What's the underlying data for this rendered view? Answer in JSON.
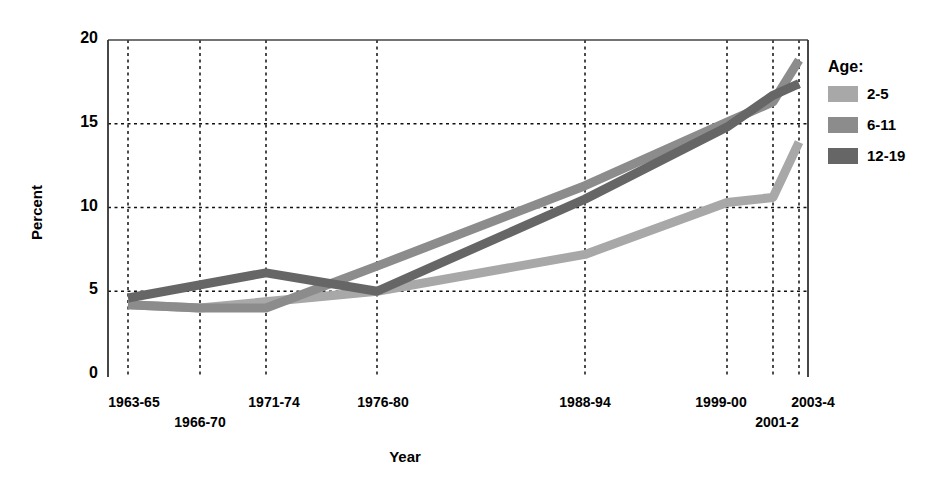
{
  "chart_data": {
    "type": "line",
    "title": "",
    "xlabel": "Year",
    "ylabel": "Percent",
    "categories": [
      "1963-65",
      "1966-70",
      "1971-74",
      "1976-80",
      "1988-94",
      "1999-00",
      "2001-2",
      "2003-4"
    ],
    "x_positions": [
      128,
      200,
      266,
      377,
      585,
      727,
      773,
      799
    ],
    "ylim": [
      0,
      20
    ],
    "yticks": [
      0,
      5,
      10,
      15,
      20
    ],
    "grid": true,
    "legend_position": "right",
    "legend_title": "Age:",
    "series": [
      {
        "name": "2-5",
        "color": "#a8a8a8",
        "values": [
          4.2,
          4.0,
          null,
          5.0,
          7.2,
          10.3,
          10.6,
          13.9
        ]
      },
      {
        "name": "6-11",
        "color": "#8c8c8c",
        "values": [
          4.2,
          4.0,
          4.0,
          6.5,
          11.3,
          15.1,
          16.3,
          18.8
        ]
      },
      {
        "name": "12-19",
        "color": "#666666",
        "values": [
          4.6,
          null,
          6.1,
          5.0,
          10.5,
          14.8,
          16.7,
          17.4
        ]
      }
    ]
  },
  "axis": {
    "y_tick_labels": [
      "20",
      "15",
      "10",
      "5",
      "0"
    ],
    "x_tick_labels": [
      "1963-65",
      "1966-70",
      "1971-74",
      "1976-80",
      "1988-94",
      "1999-00",
      "2001-2",
      "2003-4"
    ],
    "y_axis_title": "Percent",
    "x_axis_title": "Year"
  },
  "legend": {
    "title": "Age:",
    "items": [
      {
        "label": "2-5",
        "color": "#a8a8a8"
      },
      {
        "label": "6-11",
        "color": "#8c8c8c"
      },
      {
        "label": "12-19",
        "color": "#666666"
      }
    ]
  }
}
